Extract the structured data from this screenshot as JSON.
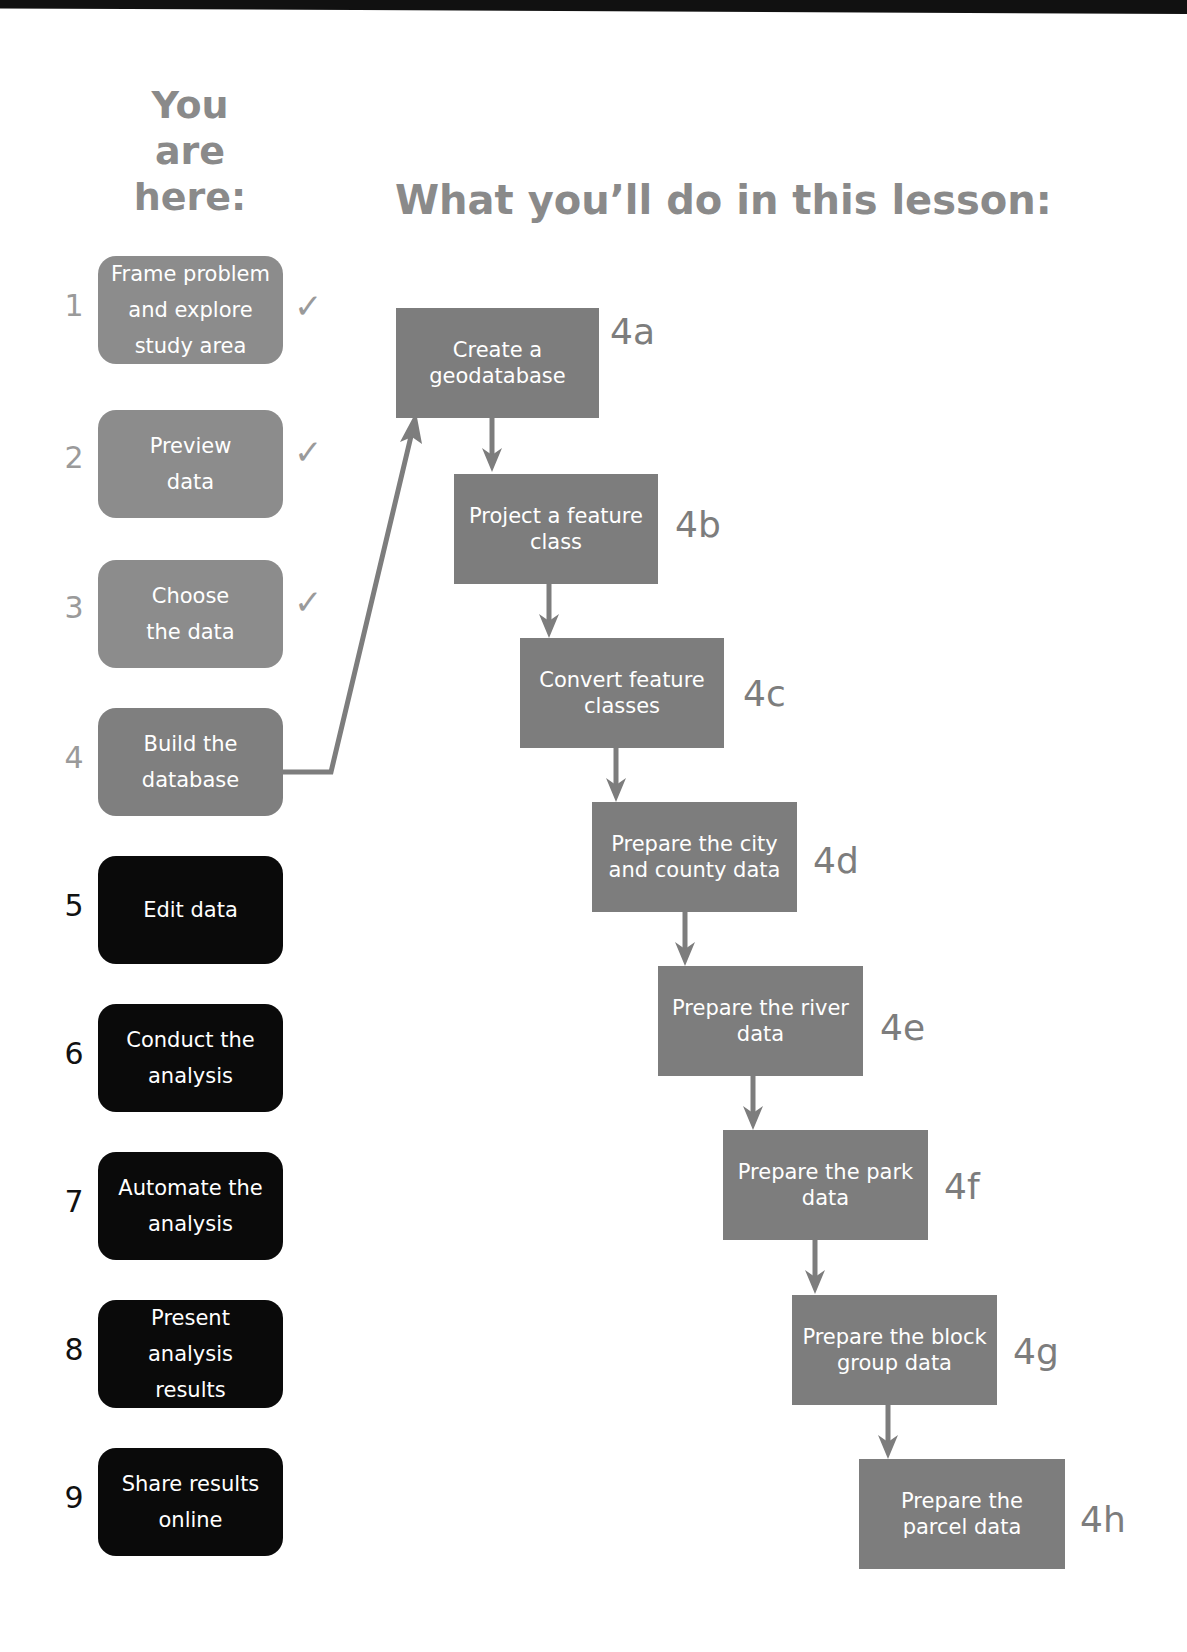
{
  "header": {
    "you_are_here": [
      "You",
      "are",
      "here:"
    ],
    "lesson_title": "What you’ll do in this lesson:"
  },
  "steps": [
    {
      "num": "1",
      "label": "Frame problem and explore study area",
      "status": "done",
      "check": "✓"
    },
    {
      "num": "2",
      "label": "Preview data",
      "status": "done",
      "check": "✓"
    },
    {
      "num": "3",
      "label": "Choose the data",
      "status": "done",
      "check": "✓"
    },
    {
      "num": "4",
      "label": "Build the database",
      "status": "current"
    },
    {
      "num": "5",
      "label": "Edit data",
      "status": "todo"
    },
    {
      "num": "6",
      "label": "Conduct the analysis",
      "status": "todo"
    },
    {
      "num": "7",
      "label": "Automate the analysis",
      "status": "todo"
    },
    {
      "num": "8",
      "label": "Present analysis results",
      "status": "todo"
    },
    {
      "num": "9",
      "label": "Share results online",
      "status": "todo"
    }
  ],
  "lesson_steps": [
    {
      "id": "4a",
      "label": "Create a geodatabase"
    },
    {
      "id": "4b",
      "label": "Project a feature class"
    },
    {
      "id": "4c",
      "label": "Convert feature classes"
    },
    {
      "id": "4d",
      "label": "Prepare the city and county data"
    },
    {
      "id": "4e",
      "label": "Prepare the river data"
    },
    {
      "id": "4f",
      "label": "Prepare the park data"
    },
    {
      "id": "4g",
      "label": "Prepare the block group data"
    },
    {
      "id": "4h",
      "label": "Prepare the parcel data"
    }
  ],
  "colors": {
    "completed_box": "#8c8c8c",
    "current_box": "#7f7f7f",
    "upcoming_box": "#0a0a0a",
    "flow_box": "#7d7d7d",
    "heading_text": "#8a8a8a"
  }
}
